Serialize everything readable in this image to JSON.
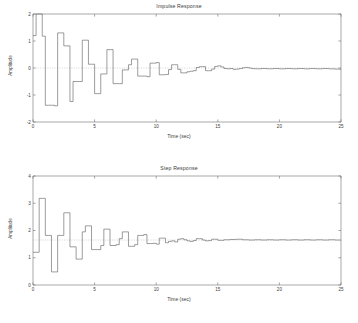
{
  "figure": {
    "background": "#ffffff",
    "trace_color": "#606060",
    "axis_color": "#6e6e6e",
    "reference_line_color": "#a8a8a8"
  },
  "panels": [
    {
      "id": "impulse",
      "title": "Impulse Response",
      "xlabel": "Time (sec)",
      "ylabel": "Amplitude"
    },
    {
      "id": "step",
      "title": "Step Response",
      "xlabel": "Time (sec)",
      "ylabel": "Amplitude"
    }
  ],
  "chart_data": [
    {
      "type": "line",
      "drawstyle": "steps-post",
      "title": "Impulse Response",
      "xlabel": "Time (sec)",
      "ylabel": "Amplitude",
      "xlim": [
        0,
        25
      ],
      "ylim": [
        -2,
        2
      ],
      "xticks": [
        0,
        5,
        10,
        15,
        20,
        25
      ],
      "xticklabels": [
        "0",
        "5",
        "10",
        "15",
        "20",
        "25"
      ],
      "yticks": [
        -2,
        -1,
        0,
        1,
        2
      ],
      "yticklabels": [
        "-2",
        "-1",
        "0",
        "1",
        "2"
      ],
      "grid": false,
      "legend": null,
      "reference_line": {
        "y": 0,
        "style": "dotted"
      },
      "x": [
        0,
        0.25,
        0.5,
        0.75,
        1.0,
        1.25,
        1.5,
        1.75,
        2.0,
        2.25,
        2.5,
        2.75,
        3.0,
        3.25,
        3.5,
        3.75,
        4.0,
        4.25,
        4.5,
        4.75,
        5.0,
        5.25,
        5.5,
        5.75,
        6.0,
        6.25,
        6.5,
        6.75,
        7.0,
        7.25,
        7.5,
        7.75,
        8.0,
        8.25,
        8.5,
        8.75,
        9.0,
        9.25,
        9.5,
        9.75,
        10.0,
        10.25,
        10.5,
        10.75,
        11.0,
        11.25,
        11.5,
        11.75,
        12.0,
        12.25,
        12.5,
        12.75,
        13.0,
        13.25,
        13.5,
        13.75,
        14.0,
        14.25,
        14.5,
        14.75,
        15.0,
        15.25,
        15.5,
        15.75,
        16.0,
        16.25,
        16.5,
        16.75,
        17.0,
        17.25,
        17.5,
        17.75,
        18.0,
        18.5,
        19.0,
        19.5,
        20.0,
        20.5,
        21.0,
        21.5,
        22.0,
        22.5,
        23.0,
        23.5,
        24.0,
        24.5,
        25.0
      ],
      "y": [
        1.2,
        2.0,
        2.0,
        1.18,
        -1.38,
        -1.38,
        -1.38,
        -1.4,
        1.3,
        1.3,
        0.82,
        0.82,
        -1.24,
        -0.5,
        -0.5,
        -0.5,
        1.03,
        1.03,
        0.14,
        0.14,
        -0.95,
        -0.95,
        -0.22,
        -0.22,
        0.68,
        0.68,
        -0.58,
        -0.58,
        -0.58,
        -0.07,
        -0.07,
        0.12,
        0.33,
        0.33,
        -0.3,
        -0.3,
        -0.3,
        -0.32,
        0.18,
        0.18,
        0.2,
        -0.25,
        -0.25,
        -0.24,
        -0.06,
        0.12,
        0.12,
        -0.05,
        -0.18,
        -0.18,
        -0.14,
        -0.12,
        -0.1,
        0.02,
        0.05,
        0.05,
        -0.1,
        -0.1,
        -0.04,
        0.06,
        0.08,
        0.04,
        -0.02,
        -0.03,
        -0.02,
        -0.05,
        -0.04,
        -0.02,
        0.01,
        0.02,
        0.0,
        -0.02,
        -0.03,
        -0.02,
        -0.03,
        -0.02,
        -0.03,
        -0.02,
        -0.03,
        -0.02,
        -0.03,
        -0.02,
        -0.03,
        -0.02,
        -0.03,
        -0.04,
        -0.05
      ]
    },
    {
      "type": "line",
      "drawstyle": "steps-post",
      "title": "Step Response",
      "xlabel": "Time (sec)",
      "ylabel": "Amplitude",
      "xlim": [
        0,
        25
      ],
      "ylim": [
        0,
        4
      ],
      "xticks": [
        0,
        5,
        10,
        15,
        20,
        25
      ],
      "xticklabels": [
        "0",
        "5",
        "10",
        "15",
        "20",
        "25"
      ],
      "yticks": [
        0,
        1,
        2,
        3,
        4
      ],
      "yticklabels": [
        "0",
        "1",
        "2",
        "3",
        "4"
      ],
      "grid": false,
      "legend": null,
      "reference_line": {
        "y": 1.65,
        "style": "dotted"
      },
      "x": [
        0,
        0.25,
        0.5,
        0.75,
        1.0,
        1.25,
        1.5,
        1.75,
        2.0,
        2.25,
        2.5,
        2.75,
        3.0,
        3.25,
        3.5,
        3.75,
        4.0,
        4.25,
        4.5,
        4.75,
        5.0,
        5.25,
        5.5,
        5.75,
        6.0,
        6.25,
        6.5,
        6.75,
        7.0,
        7.25,
        7.5,
        7.75,
        8.0,
        8.25,
        8.5,
        8.75,
        9.0,
        9.25,
        9.5,
        9.75,
        10.0,
        10.25,
        10.5,
        10.75,
        11.0,
        11.25,
        11.5,
        11.75,
        12.0,
        12.25,
        12.5,
        12.75,
        13.0,
        13.25,
        13.5,
        13.75,
        14.0,
        14.25,
        14.5,
        14.75,
        15.0,
        15.5,
        16.0,
        16.5,
        17.0,
        17.5,
        18.0,
        18.5,
        19.0,
        19.5,
        20.0,
        20.5,
        21.0,
        21.5,
        22.0,
        22.5,
        23.0,
        23.5,
        24.0,
        24.5,
        25.0
      ],
      "y": [
        1.2,
        1.2,
        3.18,
        3.18,
        1.82,
        1.82,
        0.48,
        0.48,
        1.82,
        1.82,
        2.65,
        2.65,
        1.4,
        1.4,
        0.95,
        0.95,
        1.95,
        2.17,
        2.17,
        1.3,
        1.3,
        1.3,
        1.45,
        2.05,
        2.05,
        1.45,
        1.45,
        1.48,
        1.7,
        1.95,
        1.95,
        1.42,
        1.42,
        1.48,
        1.82,
        1.82,
        1.85,
        1.52,
        1.52,
        1.53,
        1.5,
        1.72,
        1.72,
        1.55,
        1.6,
        1.62,
        1.58,
        1.68,
        1.7,
        1.66,
        1.62,
        1.6,
        1.63,
        1.7,
        1.7,
        1.65,
        1.62,
        1.63,
        1.68,
        1.68,
        1.64,
        1.66,
        1.67,
        1.68,
        1.66,
        1.65,
        1.66,
        1.65,
        1.66,
        1.65,
        1.66,
        1.65,
        1.66,
        1.65,
        1.66,
        1.65,
        1.66,
        1.65,
        1.66,
        1.65,
        1.64
      ]
    }
  ]
}
